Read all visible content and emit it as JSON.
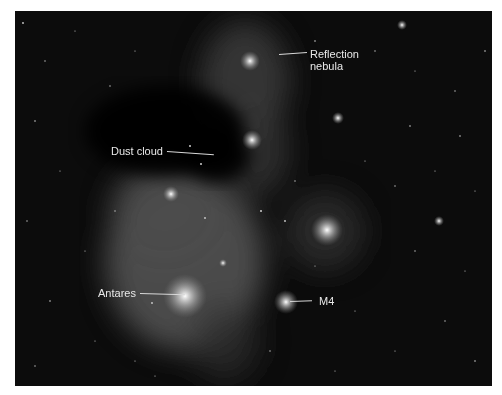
{
  "figure": {
    "labels": [
      {
        "id": "reflection-nebula",
        "text_line1": "Reflection",
        "text_line2": "nebula"
      },
      {
        "id": "dust-cloud",
        "text": "Dust cloud"
      },
      {
        "id": "antares",
        "text": "Antares"
      },
      {
        "id": "m4",
        "text": "M4"
      }
    ]
  }
}
